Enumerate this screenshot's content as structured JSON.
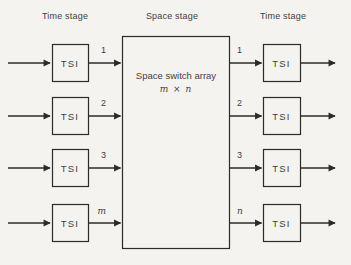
{
  "headers": {
    "left": "Time stage",
    "center": "Space stage",
    "right": "Time stage"
  },
  "tsi_label": "TSI",
  "space_box": {
    "title": "Space switch array",
    "size": "m × n"
  },
  "left_link_labels": [
    "1",
    "2",
    "3",
    "m"
  ],
  "right_link_labels": [
    "1",
    "2",
    "3",
    "n"
  ],
  "colors": {
    "background": "#f4f3ef",
    "line": "#2b2b2b",
    "text": "#3f3f3f"
  }
}
